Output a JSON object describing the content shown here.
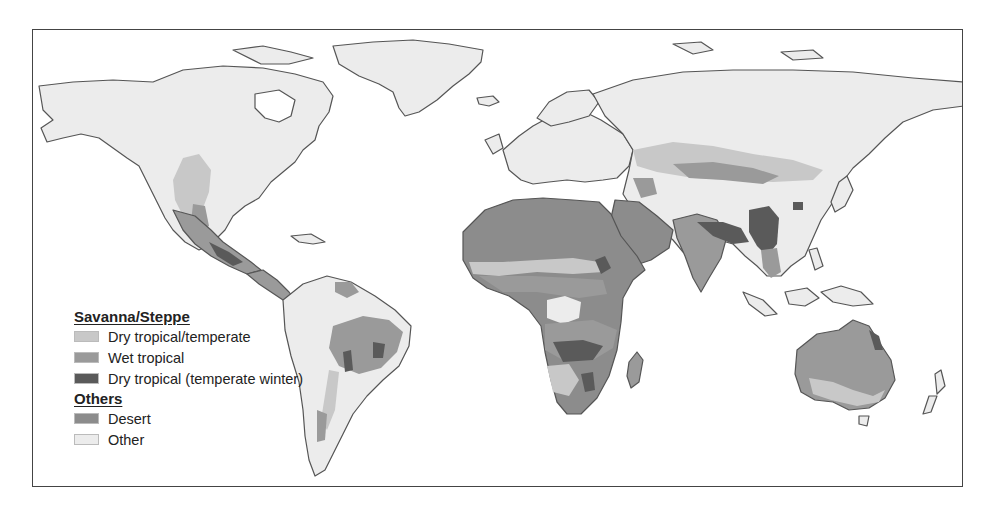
{
  "map": {
    "subject": "Global distribution of savanna/steppe climate types",
    "colors": {
      "ocean": "#ffffff",
      "coastline": "#555555",
      "border": "#7a7a7a",
      "dry_tropical_temperate": "#c8c8c8",
      "wet_tropical": "#9a9a9a",
      "dry_tropical_temperate_winter": "#5a5a5a",
      "desert": "#8c8c8c",
      "other": "#ececec"
    }
  },
  "legend": {
    "groups": [
      {
        "heading": "Savanna/Steppe",
        "items": [
          {
            "label": "Dry tropical/temperate",
            "color": "#c8c8c8"
          },
          {
            "label": "Wet tropical",
            "color": "#9a9a9a"
          },
          {
            "label": "Dry tropical (temperate winter)",
            "color": "#5a5a5a"
          }
        ]
      },
      {
        "heading": "Others",
        "items": [
          {
            "label": "Desert",
            "color": "#8c8c8c"
          },
          {
            "label": "Other",
            "color": "#ececec"
          }
        ]
      }
    ]
  }
}
